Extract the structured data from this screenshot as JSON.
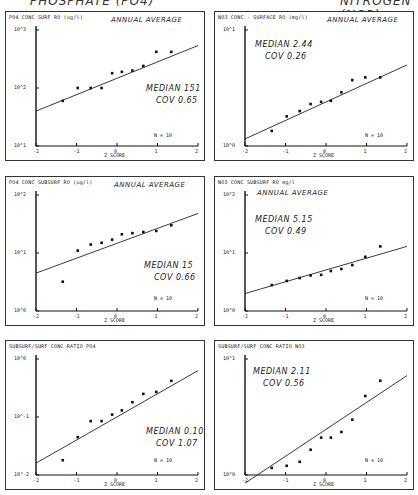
{
  "header": {
    "left": "PHOSPHATE (PO4)",
    "right": "NITROGEN (NO3)"
  },
  "chart_data": [
    {
      "type": "scatter",
      "title": "PO4 CONC SURF RO (ug/l)",
      "subtitle": "ANNUAL AVERAGE",
      "xlabel": "Z SCORE",
      "ylabel": "PO4 CONC SURF RO (ug/l)",
      "x_ticks": [
        "-2",
        "-1",
        "0",
        "1",
        "2"
      ],
      "y_ticks": [
        "10^3",
        "10^2",
        "10^1"
      ],
      "y_scale": "log",
      "ylim": [
        10,
        1000
      ],
      "xlim": [
        -2,
        2
      ],
      "x": [
        -1.34,
        -0.97,
        -0.65,
        -0.38,
        -0.12,
        0.12,
        0.38,
        0.65,
        0.97,
        1.34
      ],
      "y": [
        60,
        100,
        100,
        100,
        180,
        190,
        200,
        240,
        420,
        420
      ],
      "fit_line": {
        "x": [
          -2,
          2
        ],
        "y": [
          40,
          540
        ]
      },
      "stats": {
        "median": "MEDIAN 151",
        "cov": "COV 0.65",
        "n": "N = 10"
      }
    },
    {
      "type": "scatter",
      "title": "NO3 CONC - SURFACE RO (mg/l)",
      "subtitle": "ANNUAL AVERAGE",
      "xlabel": "Z SCORE",
      "ylabel": "NO3 CONC - SURFACE RO (mg/l)",
      "x_ticks": [
        "-2",
        "-1",
        "0",
        "1",
        "2"
      ],
      "y_ticks": [
        "10^1",
        "10^0"
      ],
      "y_scale": "log",
      "ylim": [
        1,
        10
      ],
      "xlim": [
        -2,
        2
      ],
      "x": [
        -1.34,
        -0.97,
        -0.65,
        -0.38,
        -0.12,
        0.12,
        0.38,
        0.65,
        0.97,
        1.34
      ],
      "y": [
        1.35,
        1.8,
        2.0,
        2.3,
        2.4,
        2.45,
        2.9,
        3.7,
        3.9,
        3.9
      ],
      "fit_line": {
        "x": [
          -2,
          2
        ],
        "y": [
          1.15,
          5.0
        ]
      },
      "stats": {
        "median": "MEDIAN 2.44",
        "cov": "COV 0.26",
        "n": "N = 10"
      }
    },
    {
      "type": "scatter",
      "title": "PO4 CONC SUBSURF RO (ug/l)",
      "subtitle": "ANNUAL AVERAGE",
      "xlabel": "Z SCORE",
      "ylabel": "PO4 CONC SUBSURF RO (ug/l)",
      "x_ticks": [
        "-2",
        "-1",
        "0",
        "1",
        "2"
      ],
      "y_ticks": [
        "10^2",
        "10^1",
        "10^0"
      ],
      "y_scale": "log",
      "ylim": [
        1,
        100
      ],
      "xlim": [
        -2,
        2
      ],
      "x": [
        -1.34,
        -0.97,
        -0.65,
        -0.38,
        -0.12,
        0.12,
        0.38,
        0.65,
        0.97,
        1.34
      ],
      "y": [
        3.2,
        11,
        14,
        15,
        17,
        21,
        22,
        23,
        24,
        30
      ],
      "fit_line": {
        "x": [
          -2,
          2
        ],
        "y": [
          4.5,
          48
        ]
      },
      "stats": {
        "median": "MEDIAN 15",
        "cov": "COV 0.66",
        "n": "N = 10"
      }
    },
    {
      "type": "scatter",
      "title": "NO3 CONC SUBSURF RO mg/l",
      "subtitle": "ANNUAL AVERAGE",
      "xlabel": "Z SCORE",
      "ylabel": "NO3 CONC SUBSURF RO mg/l",
      "x_ticks": [
        "-2",
        "-1",
        "0",
        "1",
        "2"
      ],
      "y_ticks": [
        "10^2",
        "10^1",
        "10^0"
      ],
      "y_scale": "log",
      "ylim": [
        1,
        100
      ],
      "xlim": [
        -2,
        2
      ],
      "x": [
        -1.34,
        -0.97,
        -0.65,
        -0.38,
        -0.12,
        0.12,
        0.38,
        0.65,
        0.97,
        1.34
      ],
      "y": [
        2.8,
        3.3,
        3.7,
        4.1,
        4.2,
        4.9,
        5.3,
        6.2,
        8.6,
        13
      ],
      "fit_line": {
        "x": [
          -2,
          2
        ],
        "y": [
          2.0,
          13
        ]
      },
      "stats": {
        "median": "MEDIAN 5.15",
        "cov": "COV 0.49",
        "n": "N = 10"
      }
    },
    {
      "type": "scatter",
      "title": "SUBSURF/SURF CONC RATIO PO4",
      "subtitle": "",
      "xlabel": "Z SCORE",
      "ylabel": "SUBSURF/SURF CONC RATIO PO4",
      "x_ticks": [
        "-2",
        "-1",
        "0",
        "1",
        "2"
      ],
      "y_ticks": [
        "10^0",
        "10^-1",
        "10^-2"
      ],
      "y_scale": "log",
      "ylim": [
        0.01,
        1
      ],
      "xlim": [
        -2,
        2
      ],
      "x": [
        -1.34,
        -0.97,
        -0.65,
        -0.38,
        -0.12,
        0.12,
        0.38,
        0.65,
        0.97,
        1.34
      ],
      "y": [
        0.018,
        0.045,
        0.085,
        0.085,
        0.11,
        0.13,
        0.18,
        0.25,
        0.27,
        0.42
      ],
      "fit_line": {
        "x": [
          -2,
          2
        ],
        "y": [
          0.016,
          0.63
        ]
      },
      "stats": {
        "median": "MEDIAN 0.10",
        "cov": "COV 1.07",
        "n": "N = 10"
      }
    },
    {
      "type": "scatter",
      "title": "SUBSURF/SURF CONC RATIO NO3",
      "subtitle": "",
      "xlabel": "Z SCORE",
      "ylabel": "SUBSURF/SURF CONC RATIO NO3",
      "x_ticks": [
        "-2",
        "-1",
        "0",
        "1",
        "2"
      ],
      "y_ticks": [
        "10^1",
        "10^0"
      ],
      "y_scale": "log",
      "ylim": [
        1,
        10
      ],
      "xlim": [
        -2,
        2
      ],
      "x": [
        -1.34,
        -0.97,
        -0.65,
        -0.38,
        -0.12,
        0.12,
        0.38,
        0.65,
        0.97,
        1.34
      ],
      "y": [
        1.15,
        1.2,
        1.3,
        1.65,
        2.1,
        2.1,
        2.35,
        3.0,
        4.8,
        6.5
      ],
      "fit_line": {
        "x": [
          -2,
          2
        ],
        "y": [
          0.85,
          7.2
        ]
      },
      "stats": {
        "median": "MEDIAN 2.11",
        "cov": "COV 0.56",
        "n": "N = 10"
      }
    }
  ],
  "panels": [
    {
      "title": "PO4 CONC SURF RO (ug/l)",
      "subtitle": "ANNUAL AVERAGE",
      "median": "MEDIAN 151",
      "cov": "COV 0.65",
      "n": "N = 10",
      "y_ticks": [
        "10^3",
        "10^2",
        "10^1"
      ],
      "xlabel": "Z SCORE"
    },
    {
      "title": "NO3 CONC - SURFACE RO (mg/l)",
      "subtitle": "ANNUAL AVERAGE",
      "median": "MEDIAN 2.44",
      "cov": "COV 0.26",
      "n": "N = 10",
      "y_ticks": [
        "10^1",
        "10^0"
      ],
      "xlabel": "Z SCORE"
    },
    {
      "title": "PO4 CONC SUBSURF RO (ug/l)",
      "subtitle": "ANNUAL AVERAGE",
      "median": "MEDIAN 15",
      "cov": "COV 0.66",
      "n": "N = 10",
      "y_ticks": [
        "10^2",
        "10^1",
        "10^0"
      ],
      "xlabel": "Z SCORE"
    },
    {
      "title": "NO3 CONC SUBSURF RO mg/l",
      "subtitle": "ANNUAL AVERAGE",
      "median": "MEDIAN 5.15",
      "cov": "COV 0.49",
      "n": "N = 10",
      "y_ticks": [
        "10^2",
        "10^1",
        "10^0"
      ],
      "xlabel": "Z SCORE"
    },
    {
      "title": "SUBSURF/SURF CONC RATIO PO4",
      "subtitle": "",
      "median": "MEDIAN 0.10",
      "cov": "COV 1.07",
      "n": "N = 10",
      "y_ticks": [
        "10^0",
        "10^-1",
        "10^-2"
      ],
      "xlabel": "Z SCORE"
    },
    {
      "title": "SUBSURF/SURF CONC RATIO NO3",
      "subtitle": "",
      "median": "MEDIAN 2.11",
      "cov": "COV 0.56",
      "n": "N = 10",
      "y_ticks": [
        "10^1",
        "10^0"
      ],
      "xlabel": "Z SCORE"
    }
  ]
}
